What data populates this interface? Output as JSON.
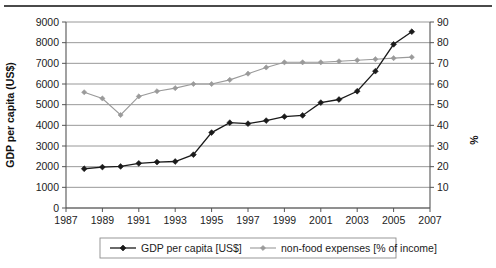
{
  "chart_data": {
    "type": "line",
    "title": "",
    "xlabel": "",
    "ylabel": "GDP per capita (US$)",
    "y2label": "%",
    "x": [
      1988,
      1989,
      1990,
      1991,
      1992,
      1993,
      1994,
      1995,
      1996,
      1997,
      1998,
      1999,
      2000,
      2001,
      2002,
      2003,
      2004,
      2005,
      2006
    ],
    "xlim": [
      1987,
      2007
    ],
    "xticks": [
      1987,
      1989,
      1991,
      1993,
      1995,
      1997,
      1999,
      2001,
      2003,
      2005,
      2007
    ],
    "xticklabels": [
      "1987",
      "1989",
      "1991",
      "1993",
      "1995",
      "1997",
      "1999",
      "2001",
      "2003",
      "2005",
      "2007"
    ],
    "ylim": [
      0,
      9000
    ],
    "yticks": [
      0,
      1000,
      2000,
      3000,
      4000,
      5000,
      6000,
      7000,
      8000,
      9000
    ],
    "yticklabels": [
      "0",
      "1000",
      "2000",
      "3000",
      "4000",
      "5000",
      "6000",
      "7000",
      "8000",
      "9000"
    ],
    "y2lim": [
      0,
      90
    ],
    "y2ticks": [
      10,
      20,
      30,
      40,
      50,
      60,
      70,
      80,
      90
    ],
    "y2ticklabels": [
      "10",
      "20",
      "30",
      "40",
      "50",
      "60",
      "70",
      "80",
      "90"
    ],
    "grid": true,
    "legend_position": "bottom",
    "series": [
      {
        "name": "GDP per capita [US$]",
        "axis": "left",
        "color": "#1a1a1a",
        "marker": "diamond",
        "values": [
          1900,
          1980,
          2010,
          2160,
          2220,
          2250,
          2580,
          3650,
          4130,
          4080,
          4230,
          4420,
          4480,
          5100,
          5250,
          5650,
          6620,
          7920,
          8530
        ]
      },
      {
        "name": "non-food expenses [% of income]",
        "axis": "right",
        "color": "#9a9a9a",
        "marker": "diamond",
        "values": [
          56,
          53,
          45,
          54,
          56.5,
          58,
          60,
          60,
          62,
          65,
          68,
          70.5,
          70.5,
          70.5,
          71,
          71.5,
          72,
          72.5,
          73
        ]
      }
    ]
  },
  "legend": {
    "items": [
      {
        "label": "GDP per capita [US$]",
        "color": "#1a1a1a"
      },
      {
        "label": "non-food expenses [% of income]",
        "color": "#9a9a9a"
      }
    ]
  }
}
